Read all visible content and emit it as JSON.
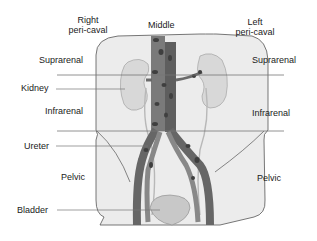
{
  "figure": {
    "type": "anatomical-diagram"
  },
  "column_labels": {
    "right": [
      "Right",
      "peri-caval"
    ],
    "middle": "Middle",
    "left": [
      "Left",
      "peri-caval"
    ]
  },
  "region_labels": {
    "left_side": {
      "suprarenal": "Suprarenal",
      "infrarenal": "Infrarenal",
      "pelvic": "Pelvic"
    },
    "right_side": {
      "suprarenal": "Suprarenal",
      "infrarenal": "Infrarenal",
      "pelvic": "Pelvic"
    }
  },
  "structure_labels": {
    "kidney": "Kidney",
    "ureter": "Ureter",
    "bladder": "Bladder"
  },
  "colors": {
    "body_fill": "#ececec",
    "outline": "#555555",
    "vessel": "#6e6e6e",
    "vessel_dark": "#4a4a4a",
    "kidney": "#d8d8d8",
    "bladder": "#c8c8c8",
    "divider": "#777777",
    "text": "#1a1a1a"
  }
}
